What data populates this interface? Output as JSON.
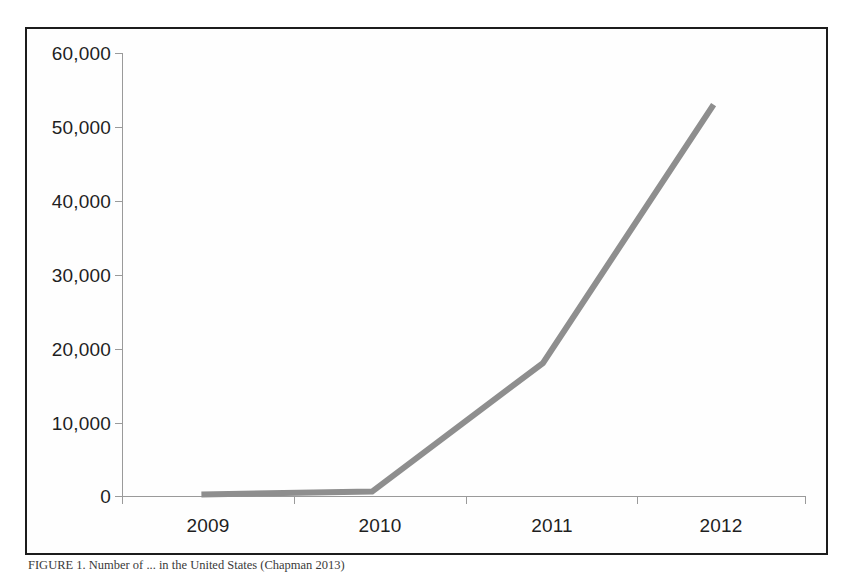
{
  "figure": {
    "caption": "FIGURE 1. Number of ... in the United States (Chapman 2013)",
    "border_color": "#1c1c1c",
    "background": "#ffffff"
  },
  "chart_data": {
    "type": "line",
    "title": "",
    "subtitle": "",
    "xlabel": "",
    "ylabel": "",
    "categories": [
      "2009",
      "2010",
      "2011",
      "2012"
    ],
    "series": [
      {
        "name": "Series 1",
        "color": "#8e8e8e",
        "values": [
          200,
          600,
          18000,
          53000
        ]
      }
    ],
    "values": [
      200,
      600,
      18000,
      53000
    ],
    "ylim": [
      0,
      60000
    ],
    "ytick_labels": [
      "0",
      "10,000",
      "20,000",
      "30,000",
      "40,000",
      "50,000",
      "60,000"
    ],
    "ytick_values": [
      0,
      10000,
      20000,
      30000,
      40000,
      50000,
      60000
    ],
    "xtick_labels": [
      "2009",
      "2010",
      "2011",
      "2012"
    ],
    "grid": false,
    "legend": "none",
    "line_width": 6,
    "marker": "none",
    "axis_color": "#9a9a9a"
  },
  "axis": {
    "y_labels": [
      "60,000",
      "50,000",
      "40,000",
      "30,000",
      "20,000",
      "10,000",
      "0"
    ],
    "x_labels": [
      "2009",
      "2010",
      "2011",
      "2012"
    ]
  }
}
